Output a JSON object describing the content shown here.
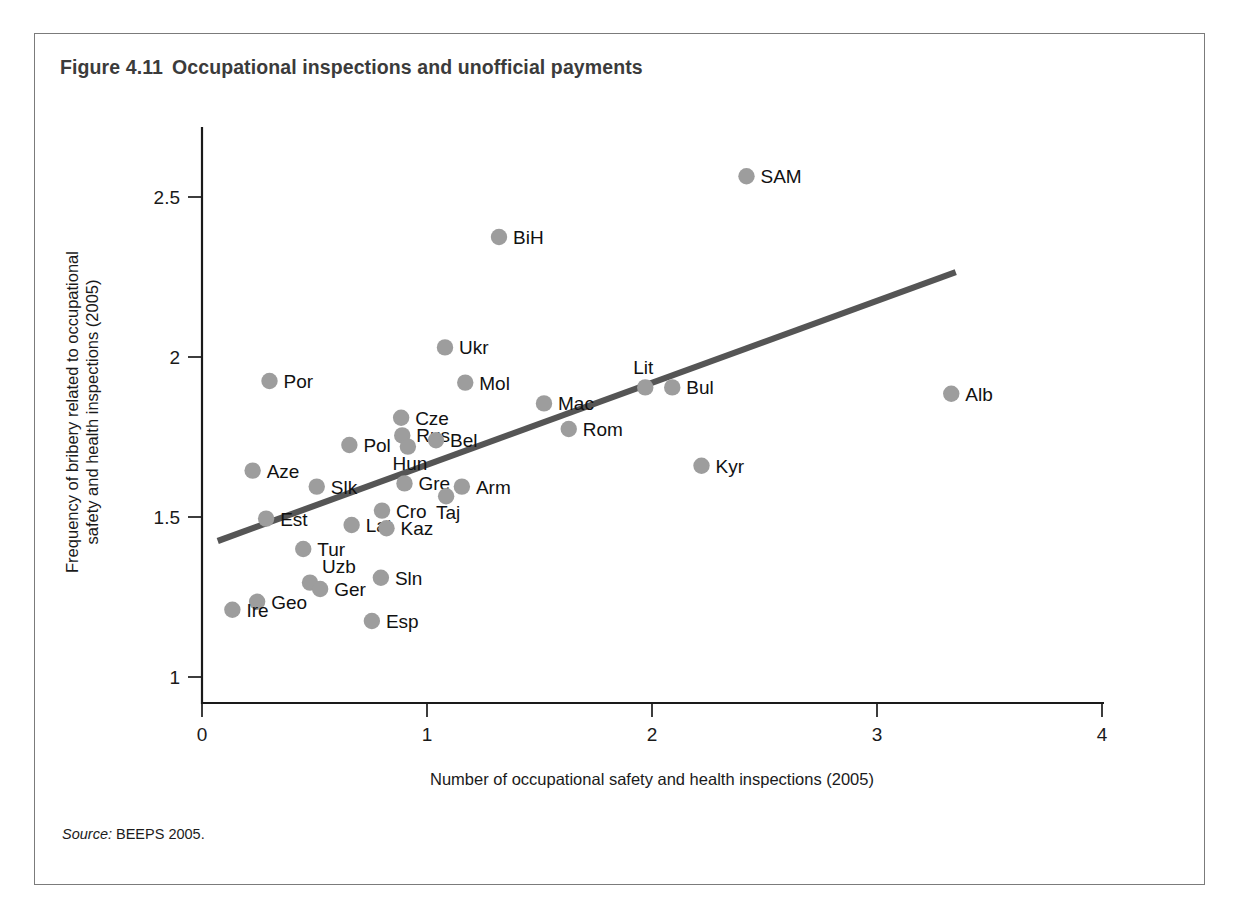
{
  "figure": {
    "number": "Figure 4.11",
    "title": "Occupational inspections and unofficial payments",
    "source_label": "Source:",
    "source_text": "BEEPS 2005."
  },
  "colors": {
    "marker": "#9d9d9d",
    "trendline": "#555555",
    "axis": "#1a1a1a",
    "frame": "#7b7b7b",
    "title": "#3b3b3b"
  },
  "chart_data": {
    "type": "scatter",
    "title": "Occupational inspections and unofficial payments",
    "xlabel": "Number of occupational safety and health inspections (2005)",
    "ylabel": "Frequency of bribery related to occupational safety and health inspections (2005)",
    "xlim": [
      0,
      4
    ],
    "ylim": [
      1,
      2.7
    ],
    "xticks": [
      0,
      1,
      2,
      3,
      4
    ],
    "xtick_labels": [
      "0",
      "1",
      "2",
      "3",
      "4"
    ],
    "yticks": [
      1,
      1.5,
      2,
      2.5
    ],
    "ytick_labels": [
      "1",
      "1.5",
      "2",
      "2.5"
    ],
    "grid": false,
    "legend": false,
    "points": [
      {
        "label": "SAM",
        "x": 2.42,
        "y": 2.565,
        "label_pos": "right"
      },
      {
        "label": "BiH",
        "x": 1.32,
        "y": 2.375,
        "label_pos": "right"
      },
      {
        "label": "Ukr",
        "x": 1.08,
        "y": 2.03,
        "label_pos": "right"
      },
      {
        "label": "Por",
        "x": 0.3,
        "y": 1.925,
        "label_pos": "right"
      },
      {
        "label": "Mol",
        "x": 1.17,
        "y": 1.92,
        "label_pos": "right"
      },
      {
        "label": "Lit",
        "x": 1.97,
        "y": 1.905,
        "label_pos": "above"
      },
      {
        "label": "Bul",
        "x": 2.09,
        "y": 1.905,
        "label_pos": "right"
      },
      {
        "label": "Alb",
        "x": 3.33,
        "y": 1.885,
        "label_pos": "right"
      },
      {
        "label": "Mac",
        "x": 1.52,
        "y": 1.855,
        "label_pos": "right"
      },
      {
        "label": "Cze",
        "x": 0.885,
        "y": 1.81,
        "label_pos": "right"
      },
      {
        "label": "Rom",
        "x": 1.63,
        "y": 1.775,
        "label_pos": "right"
      },
      {
        "label": "Rus",
        "x": 0.89,
        "y": 1.755,
        "label_pos": "right"
      },
      {
        "label": "Bel",
        "x": 1.04,
        "y": 1.74,
        "label_pos": "right"
      },
      {
        "label": "Pol",
        "x": 0.655,
        "y": 1.725,
        "label_pos": "right"
      },
      {
        "label": "Hun",
        "x": 0.915,
        "y": 1.72,
        "label_pos": "below"
      },
      {
        "label": "Kyr",
        "x": 2.22,
        "y": 1.66,
        "label_pos": "right"
      },
      {
        "label": "Aze",
        "x": 0.225,
        "y": 1.645,
        "label_pos": "right"
      },
      {
        "label": "Slk",
        "x": 0.51,
        "y": 1.595,
        "label_pos": "right"
      },
      {
        "label": "Arm",
        "x": 1.155,
        "y": 1.595,
        "label_pos": "right"
      },
      {
        "label": "Gre",
        "x": 0.9,
        "y": 1.605,
        "label_pos": "right"
      },
      {
        "label": "Taj",
        "x": 1.085,
        "y": 1.565,
        "label_pos": "below"
      },
      {
        "label": "Cro",
        "x": 0.8,
        "y": 1.52,
        "label_pos": "right"
      },
      {
        "label": "Est",
        "x": 0.285,
        "y": 1.495,
        "label_pos": "right"
      },
      {
        "label": "Lat",
        "x": 0.665,
        "y": 1.475,
        "label_pos": "right"
      },
      {
        "label": "Kaz",
        "x": 0.82,
        "y": 1.465,
        "label_pos": "right"
      },
      {
        "label": "Tur",
        "x": 0.45,
        "y": 1.4,
        "label_pos": "right"
      },
      {
        "label": "Sln",
        "x": 0.795,
        "y": 1.31,
        "label_pos": "right"
      },
      {
        "label": "Uzb",
        "x": 0.48,
        "y": 1.295,
        "label_pos": "above-right"
      },
      {
        "label": "Ger",
        "x": 0.525,
        "y": 1.275,
        "label_pos": "right"
      },
      {
        "label": "Geo",
        "x": 0.245,
        "y": 1.235,
        "label_pos": "right"
      },
      {
        "label": "Ire",
        "x": 0.135,
        "y": 1.21,
        "label_pos": "right"
      },
      {
        "label": "Esp",
        "x": 0.755,
        "y": 1.175,
        "label_pos": "right"
      }
    ],
    "trend_line": {
      "x_start": 0.07,
      "y_start": 1.425,
      "x_end": 3.35,
      "y_end": 2.265
    }
  }
}
